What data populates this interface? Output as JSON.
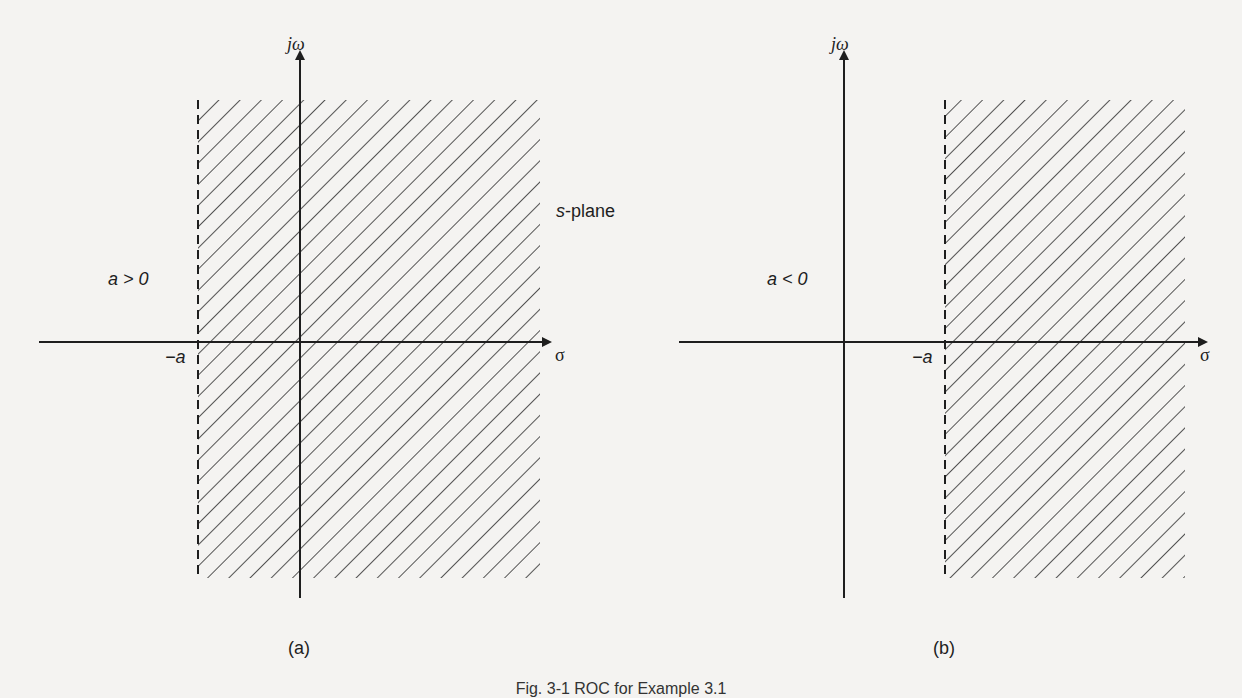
{
  "figure": {
    "caption": "Fig. 3-1 ROC for Example 3.1",
    "plane_label": "s-plane",
    "colors": {
      "ink": "#1e1e1e",
      "background": "#f4f3f1"
    }
  },
  "panels": [
    {
      "id": "a",
      "sublabel": "(a)",
      "condition": "a > 0",
      "imag_axis_label": "jω",
      "real_axis_label": "σ",
      "boundary_label": "−a",
      "roc": "Re(s) > −a (boundary left of jω-axis)"
    },
    {
      "id": "b",
      "sublabel": "(b)",
      "condition": "a < 0",
      "imag_axis_label": "jω",
      "real_axis_label": "σ",
      "boundary_label": "−a",
      "roc": "Re(s) > −a (boundary right of jω-axis)"
    }
  ]
}
